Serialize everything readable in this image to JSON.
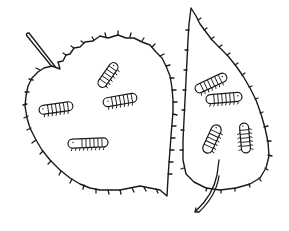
{
  "illustration": {
    "subject": "Two leaves with caterpillars",
    "background": "#ffffff",
    "line_color": "#1a1a1a",
    "left_leaf": {
      "caterpillar_count": 4
    },
    "right_leaf": {
      "caterpillar_count": 4
    }
  }
}
